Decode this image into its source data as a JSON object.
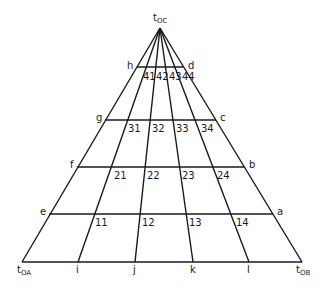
{
  "diagram": {
    "type": "triangular ternary grid",
    "apex": {
      "label": "t",
      "sub": "OC"
    },
    "base_left": {
      "label": "t",
      "sub": "OA"
    },
    "base_right": {
      "label": "t",
      "sub": "OB"
    },
    "base_points": [
      "i",
      "j",
      "k",
      "l"
    ],
    "left_side_points": [
      "e",
      "f",
      "g",
      "h"
    ],
    "right_side_points": [
      "a",
      "b",
      "c",
      "d"
    ],
    "cell_labels": {
      "row1": [
        "11",
        "12",
        "13",
        "14"
      ],
      "row2": [
        "21",
        "22",
        "23",
        "24"
      ],
      "row3": [
        "31",
        "32",
        "33",
        "34"
      ],
      "row4": [
        "41",
        "42",
        "43",
        "44"
      ]
    },
    "line_color": "#1a1a1a"
  }
}
